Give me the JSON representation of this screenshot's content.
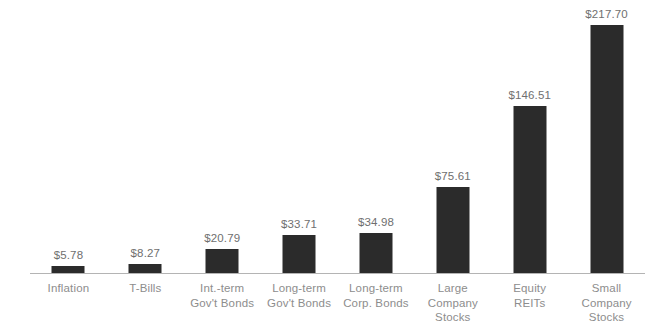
{
  "chart_data": {
    "type": "bar",
    "title": "",
    "subtitle": "",
    "xlabel": "",
    "ylabel": "",
    "ylim": [
      0,
      240
    ],
    "grid": false,
    "legend": null,
    "orientation": "vertical",
    "bar_color": "#2b2b2b",
    "axis_color": "#b4b4b4",
    "value_label_color": "#6f6f6f",
    "category_label_color": "#8d8d8d",
    "categories": [
      "Inflation",
      "Int.-term Gov't Bonds",
      "Long-term Gov't Bonds",
      "Long-term Corp. Bonds",
      "Large Company Stocks",
      "Equity REITs",
      "Small Company Stocks",
      "T-Bills"
    ],
    "values": [
      5.78,
      8.27,
      20.79,
      33.71,
      34.98,
      75.61,
      146.51,
      217.7
    ],
    "bars": [
      {
        "category": "Inflation",
        "value": 5.78,
        "value_label": "$5.78",
        "label_lines": [
          "Inflation"
        ]
      },
      {
        "category": "T-Bills",
        "value": 8.27,
        "value_label": "$8.27",
        "label_lines": [
          "T-Bills"
        ]
      },
      {
        "category": "Int.-term Gov't Bonds",
        "value": 20.79,
        "value_label": "$20.79",
        "label_lines": [
          "Int.-term",
          "Gov't Bonds"
        ]
      },
      {
        "category": "Long-term Gov't Bonds",
        "value": 33.71,
        "value_label": "$33.71",
        "label_lines": [
          "Long-term",
          "Gov't Bonds"
        ]
      },
      {
        "category": "Long-term Corp. Bonds",
        "value": 34.98,
        "value_label": "$34.98",
        "label_lines": [
          "Long-term",
          "Corp. Bonds"
        ]
      },
      {
        "category": "Large Company Stocks",
        "value": 75.61,
        "value_label": "$75.61",
        "label_lines": [
          "Large",
          "Company",
          "Stocks"
        ]
      },
      {
        "category": "Equity REITs",
        "value": 146.51,
        "value_label": "$146.51",
        "label_lines": [
          "Equity",
          "REITs"
        ]
      },
      {
        "category": "Small Company Stocks",
        "value": 217.7,
        "value_label": "$217.70",
        "label_lines": [
          "Small",
          "Company",
          "Stocks"
        ]
      }
    ]
  }
}
